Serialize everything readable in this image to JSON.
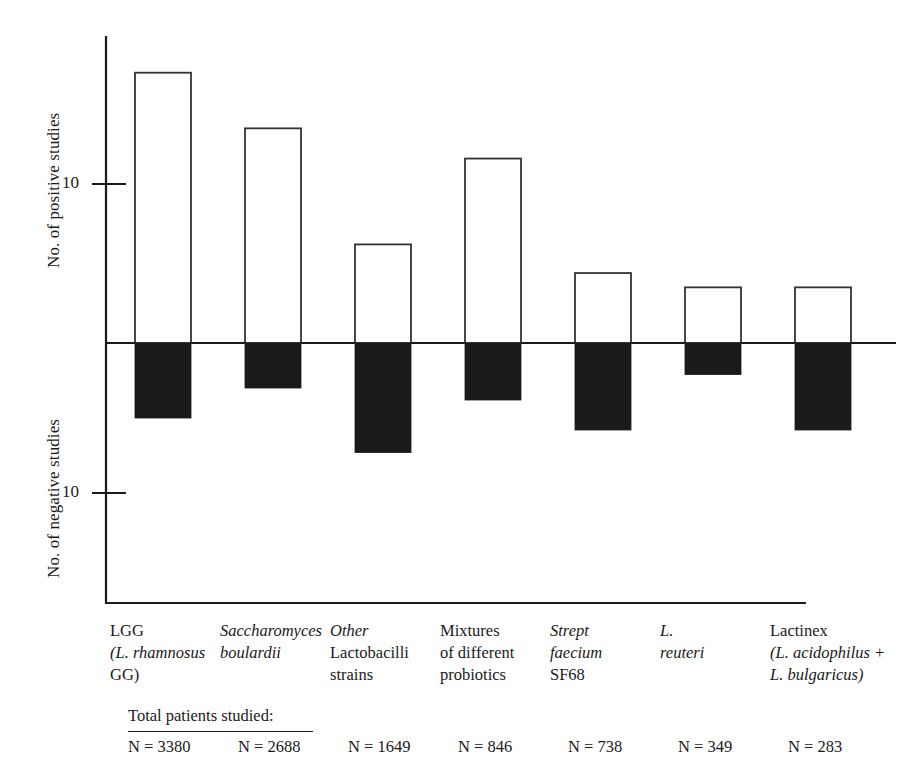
{
  "chart_data": {
    "type": "bar",
    "title": "",
    "subtitle": "",
    "orientation": "vertical",
    "grid": false,
    "legend_position": "none",
    "axis_pos_label": "No. of positive studies",
    "axis_neg_label": "No. of negative studies",
    "pos_tick_labels": [
      "10"
    ],
    "neg_tick_labels": [
      "10"
    ],
    "pos_tick_values": [
      10
    ],
    "neg_tick_values": [
      10
    ],
    "ylim_positive": [
      0,
      18
    ],
    "ylim_negative": [
      0,
      16
    ],
    "categories": [
      "LGG (L. rhamnosus GG)",
      "Saccharomyces boulardii",
      "Other Lactobacilli strains",
      "Mixtures of different probiotics",
      "Strept faecium SF68",
      "L. reuteri",
      "Lactinex (L. acidophilus + L. bulgaricus)"
    ],
    "series": [
      {
        "name": "No. of positive studies",
        "fill": "white",
        "values": [
          17,
          13.5,
          6.2,
          11.6,
          4.4,
          3.5,
          3.5
        ]
      },
      {
        "name": "No. of negative studies",
        "fill": "black",
        "values": [
          5,
          3,
          7.3,
          3.8,
          5.8,
          2.1,
          5.8
        ]
      }
    ],
    "totals_heading": "Total patients studied:",
    "totals": [
      "N = 3380",
      "N = 2688",
      "N = 1649",
      "N = 846",
      "N = 738",
      "N = 349",
      "N = 283"
    ],
    "colors": {
      "positive_fill": "#ffffff",
      "positive_stroke": "#333333",
      "negative_fill": "#1a1a1a",
      "axis": "#1a1a1a"
    }
  },
  "category_labels": [
    {
      "lines": [
        {
          "text": "LGG",
          "italic": false
        },
        {
          "text": "(L. rhamnosus",
          "italic": true,
          "prefix": "("
        },
        {
          "text": "GG)",
          "italic": false
        }
      ]
    },
    {
      "lines": [
        {
          "text": "Saccharomyces",
          "italic": true
        },
        {
          "text": "boulardii",
          "italic": true
        }
      ]
    },
    {
      "lines": [
        {
          "text": "Other",
          "italic": true
        },
        {
          "text": "Lactobacilli",
          "italic": false
        },
        {
          "text": "strains",
          "italic": false
        }
      ]
    },
    {
      "lines": [
        {
          "text": "Mixtures",
          "italic": false
        },
        {
          "text": "of different",
          "italic": false
        },
        {
          "text": "probiotics",
          "italic": false
        }
      ]
    },
    {
      "lines": [
        {
          "text": "Strept",
          "italic": true
        },
        {
          "text": "faecium",
          "italic": true
        },
        {
          "text": "SF68",
          "italic": false
        }
      ]
    },
    {
      "lines": [
        {
          "text": "L.",
          "italic": true
        },
        {
          "text": "reuteri",
          "italic": true
        }
      ]
    },
    {
      "lines": [
        {
          "text": "Lactinex",
          "italic": false
        },
        {
          "text": "(L. acidophilus +",
          "italic": true
        },
        {
          "text": "L. bulgaricus)",
          "italic": true
        }
      ]
    }
  ],
  "axis": {
    "positive_label": "No. of positive studies",
    "negative_label": "No. of negative studies",
    "positive_tick": "10",
    "negative_tick": "10"
  },
  "totals": {
    "heading": "Total patients studied:",
    "values": [
      "N = 3380",
      "N = 2688",
      "N = 1649",
      "N = 846",
      "N = 738",
      "N = 349",
      "N = 283"
    ]
  }
}
